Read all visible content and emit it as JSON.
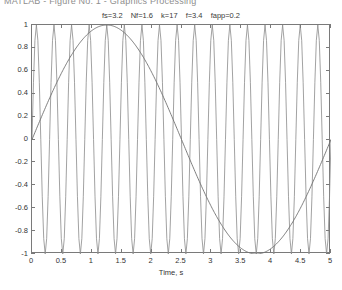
{
  "window": {
    "title": "MATLAB - Figure No. 1 - Graphics Processing"
  },
  "annotation": {
    "items": [
      "fs=3.2",
      "Nf=1.6",
      "k=17",
      "f=3.4",
      "fapp=0.2"
    ],
    "full_text": "fs=3.2 Nf=1.6 k=17 f=3.4 fapp=0.2"
  },
  "colors": {
    "axis": "#7a7a7a",
    "fast_signal": "#8a8a8a",
    "slow_signal": "#707070",
    "background": "#ffffff",
    "text": "#333333"
  },
  "chart_data": {
    "type": "line",
    "title": "fs=3.2 Nf=1.6 k=17 f=3.4 fapp=0.2",
    "xlabel": "Time, s",
    "ylabel": "",
    "xlim": [
      0,
      5
    ],
    "ylim": [
      -1,
      1
    ],
    "xticks": [
      0,
      0.5,
      1,
      1.5,
      2,
      2.5,
      3,
      3.5,
      4,
      4.5,
      5
    ],
    "xticklabels": [
      "0",
      "0.5",
      "1",
      "1.5",
      "2",
      "2.5",
      "3",
      "3.5",
      "4",
      "4.5",
      "5"
    ],
    "yticks": [
      -1,
      -0.8,
      -0.6,
      -0.4,
      -0.2,
      0,
      0.2,
      0.4,
      0.6,
      0.8,
      1
    ],
    "yticklabels": [
      "-1",
      "-0.8",
      "-0.6",
      "-0.4",
      "-0.2",
      "0",
      "0.2",
      "0.4",
      "0.6",
      "0.8",
      "1"
    ],
    "grid": false,
    "legend": null,
    "parameters": {
      "fs": 3.2,
      "Nf": 1.6,
      "k": 17,
      "f": 3.4,
      "fapp": 0.2
    },
    "series": [
      {
        "name": "original signal f=3.4 Hz",
        "kind": "sine",
        "frequency": 3.4,
        "cycles": 17,
        "amplitude": 1,
        "phase": 0,
        "description": "High-frequency sine, 17 cycles over 5 s, drawn coarsely so each cycle appears as a narrow spike spanning the full -1..1 range"
      },
      {
        "name": "apparent (aliased) signal fapp=0.2 Hz",
        "kind": "sine",
        "frequency": 0.2,
        "cycles": 1,
        "amplitude": 1,
        "phase": 0,
        "description": "Slow aliased sine, one cycle over 5 s: zero at t=0, peak +1 at t=1.25, zero at t=2.5, minimum -1 at t=3.75, zero at t=5"
      }
    ]
  }
}
